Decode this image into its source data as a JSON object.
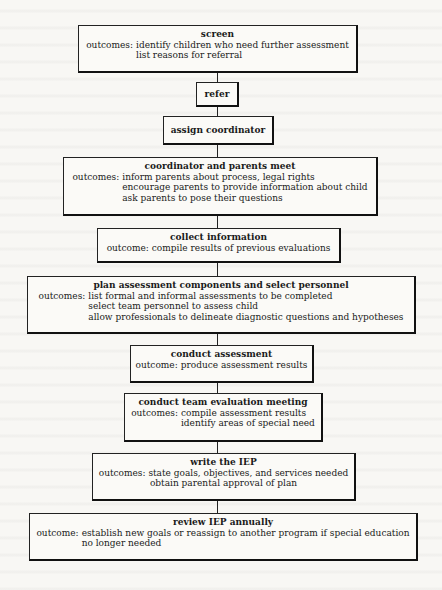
{
  "flowchart": {
    "steps": [
      {
        "id": "screen",
        "title": "screen",
        "outcome_label": "outcomes:",
        "outcomes": [
          "identify children who need further assessment",
          "list reasons for referral"
        ]
      },
      {
        "id": "refer",
        "title": "refer"
      },
      {
        "id": "assign-coordinator",
        "title": "assign coordinator"
      },
      {
        "id": "coordinator-parents-meet",
        "title": "coordinator and parents meet",
        "outcome_label": "outcomes:",
        "outcomes": [
          "inform parents about process, legal rights",
          "encourage parents to provide information about child",
          "ask parents to pose their questions"
        ]
      },
      {
        "id": "collect-information",
        "title": "collect information",
        "outcome_label": "outcome:",
        "outcomes": [
          "compile results of previous evaluations"
        ]
      },
      {
        "id": "plan-assessment",
        "title": "plan assessment components and select personnel",
        "outcome_label": "outcomes:",
        "outcomes": [
          "list formal and informal assessments to be completed",
          "select team personnel to assess child",
          "allow professionals to delineate diagnostic questions and hypotheses"
        ]
      },
      {
        "id": "conduct-assessment",
        "title": "conduct assessment",
        "outcome_label": "outcome:",
        "outcomes": [
          "produce assessment results"
        ]
      },
      {
        "id": "team-evaluation-meeting",
        "title": "conduct team evaluation meeting",
        "outcome_label": "outcomes:",
        "outcomes": [
          "compile assessment results",
          "identify areas of special need"
        ]
      },
      {
        "id": "write-iep",
        "title": "write the IEP",
        "lines": [
          "outcomes: state goals, objectives, and services needed",
          "obtain parental approval of plan"
        ]
      },
      {
        "id": "review-iep",
        "title": "review IEP annually",
        "outcome_label": "outcome:",
        "outcomes": [
          "establish new goals or reassign to another program if special education",
          "no longer needed"
        ]
      }
    ]
  },
  "colors": {
    "background": "#f8f7f4",
    "box_fill": "#fbfaf7",
    "line": "#222222",
    "text": "#1a1a1a"
  }
}
